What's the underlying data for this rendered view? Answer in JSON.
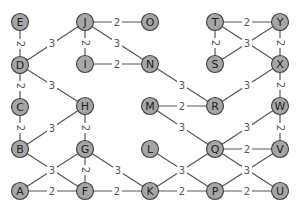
{
  "graph": {
    "node_fill": "#a6a6a6",
    "node_stroke": "#444444",
    "edge_color": "#555555",
    "nodes": [
      {
        "id": "E",
        "x": 20,
        "y": 22
      },
      {
        "id": "D",
        "x": 20,
        "y": 65
      },
      {
        "id": "C",
        "x": 20,
        "y": 107
      },
      {
        "id": "B",
        "x": 20,
        "y": 149
      },
      {
        "id": "A",
        "x": 20,
        "y": 191
      },
      {
        "id": "J",
        "x": 85,
        "y": 22
      },
      {
        "id": "I",
        "x": 85,
        "y": 64
      },
      {
        "id": "H",
        "x": 85,
        "y": 106
      },
      {
        "id": "G",
        "x": 85,
        "y": 149
      },
      {
        "id": "F",
        "x": 85,
        "y": 191
      },
      {
        "id": "O",
        "x": 150,
        "y": 22
      },
      {
        "id": "N",
        "x": 150,
        "y": 64
      },
      {
        "id": "M",
        "x": 150,
        "y": 106
      },
      {
        "id": "L",
        "x": 150,
        "y": 149
      },
      {
        "id": "K",
        "x": 150,
        "y": 191
      },
      {
        "id": "T",
        "x": 215,
        "y": 22
      },
      {
        "id": "S",
        "x": 215,
        "y": 64
      },
      {
        "id": "R",
        "x": 215,
        "y": 106
      },
      {
        "id": "Q",
        "x": 215,
        "y": 149
      },
      {
        "id": "P",
        "x": 215,
        "y": 191
      },
      {
        "id": "Y",
        "x": 280,
        "y": 22
      },
      {
        "id": "X",
        "x": 280,
        "y": 64
      },
      {
        "id": "W",
        "x": 280,
        "y": 106
      },
      {
        "id": "V",
        "x": 280,
        "y": 149
      },
      {
        "id": "U",
        "x": 280,
        "y": 191
      }
    ],
    "edges": [
      {
        "from": "E",
        "to": "D",
        "weight": "2",
        "label_at": [
          20,
          44
        ],
        "rotate": 90
      },
      {
        "from": "D",
        "to": "C",
        "weight": "2",
        "label_at": [
          20,
          86
        ],
        "rotate": 90
      },
      {
        "from": "C",
        "to": "B",
        "weight": "2",
        "label_at": [
          20,
          128
        ],
        "rotate": 90
      },
      {
        "from": "D",
        "to": "J",
        "weight": "3",
        "label_at": [
          52,
          43
        ],
        "rotate": 0
      },
      {
        "from": "D",
        "to": "H",
        "weight": "3",
        "label_at": [
          52,
          85
        ],
        "rotate": 0
      },
      {
        "from": "J",
        "to": "O",
        "weight": "2",
        "label_at": [
          117,
          22
        ],
        "rotate": 0
      },
      {
        "from": "J",
        "to": "I",
        "weight": "2",
        "label_at": [
          85,
          43
        ],
        "rotate": 90
      },
      {
        "from": "J",
        "to": "N",
        "weight": "3",
        "label_at": [
          117,
          43
        ],
        "rotate": 0
      },
      {
        "from": "I",
        "to": "N",
        "weight": "2",
        "label_at": [
          117,
          64
        ],
        "rotate": 0
      },
      {
        "from": "B",
        "to": "H",
        "weight": "3",
        "label_at": [
          52,
          128
        ],
        "rotate": 0
      },
      {
        "from": "H",
        "to": "G",
        "weight": "2",
        "label_at": [
          85,
          128
        ],
        "rotate": 90
      },
      {
        "from": "B",
        "to": "F",
        "weight": "3",
        "label_at": [
          52,
          170
        ],
        "rotate": 0
      },
      {
        "from": "A",
        "to": "G",
        "weight": "",
        "label_at": null,
        "rotate": 0
      },
      {
        "from": "A",
        "to": "F",
        "weight": "2",
        "label_at": [
          52,
          191
        ],
        "rotate": 0
      },
      {
        "from": "G",
        "to": "F",
        "weight": "2",
        "label_at": [
          85,
          170
        ],
        "rotate": 90
      },
      {
        "from": "G",
        "to": "K",
        "weight": "3",
        "label_at": [
          118,
          170
        ],
        "rotate": 0
      },
      {
        "from": "F",
        "to": "K",
        "weight": "2",
        "label_at": [
          117,
          191
        ],
        "rotate": 0
      },
      {
        "from": "N",
        "to": "R",
        "weight": "3",
        "label_at": [
          182,
          85
        ],
        "rotate": 0
      },
      {
        "from": "M",
        "to": "R",
        "weight": "2",
        "label_at": [
          182,
          106
        ],
        "rotate": 0
      },
      {
        "from": "M",
        "to": "Q",
        "weight": "3",
        "label_at": [
          182,
          127
        ],
        "rotate": 0
      },
      {
        "from": "L",
        "to": "P",
        "weight": "3",
        "label_at": [
          182,
          170
        ],
        "rotate": 0
      },
      {
        "from": "K",
        "to": "Q",
        "weight": "",
        "label_at": null,
        "rotate": 0
      },
      {
        "from": "K",
        "to": "P",
        "weight": "2",
        "label_at": [
          182,
          191
        ],
        "rotate": 0
      },
      {
        "from": "T",
        "to": "Y",
        "weight": "2",
        "label_at": [
          247,
          22
        ],
        "rotate": 0
      },
      {
        "from": "T",
        "to": "S",
        "weight": "2",
        "label_at": [
          215,
          43
        ],
        "rotate": 90
      },
      {
        "from": "T",
        "to": "X",
        "weight": "3",
        "label_at": [
          247,
          43
        ],
        "rotate": 0
      },
      {
        "from": "S",
        "to": "Y",
        "weight": "",
        "label_at": null,
        "rotate": 0
      },
      {
        "from": "Y",
        "to": "X",
        "weight": "2",
        "label_at": [
          280,
          43
        ],
        "rotate": 90
      },
      {
        "from": "R",
        "to": "X",
        "weight": "3",
        "label_at": [
          247,
          85
        ],
        "rotate": 0
      },
      {
        "from": "X",
        "to": "W",
        "weight": "2",
        "label_at": [
          280,
          85
        ],
        "rotate": 90
      },
      {
        "from": "Q",
        "to": "W",
        "weight": "3",
        "label_at": [
          247,
          127
        ],
        "rotate": 0
      },
      {
        "from": "W",
        "to": "V",
        "weight": "2",
        "label_at": [
          280,
          128
        ],
        "rotate": 90
      },
      {
        "from": "Q",
        "to": "V",
        "weight": "2",
        "label_at": [
          247,
          149
        ],
        "rotate": 0
      },
      {
        "from": "Q",
        "to": "U",
        "weight": "3",
        "label_at": [
          247,
          170
        ],
        "rotate": 0
      },
      {
        "from": "P",
        "to": "V",
        "weight": "",
        "label_at": null,
        "rotate": 0
      },
      {
        "from": "P",
        "to": "U",
        "weight": "2",
        "label_at": [
          247,
          191
        ],
        "rotate": 0
      }
    ]
  }
}
